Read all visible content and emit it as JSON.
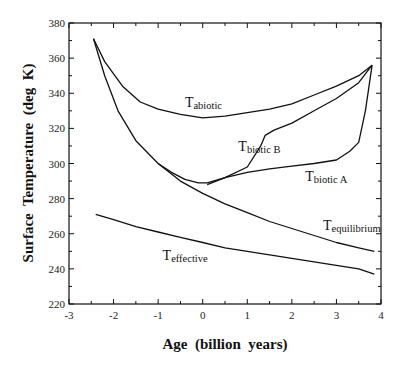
{
  "chart_data": {
    "type": "line",
    "title": "",
    "xlabel": "Age  (billion  years)",
    "ylabel": "Surface  Temperature  (deg  K)",
    "xlim": [
      -3,
      4
    ],
    "ylim": [
      220,
      380
    ],
    "xticks": [
      -3,
      -2,
      -1,
      0,
      1,
      2,
      3,
      4
    ],
    "xtick_labels": [
      "-3",
      "-2",
      "-1",
      "0",
      "1",
      "2",
      "3",
      "4"
    ],
    "yticks": [
      220,
      240,
      260,
      280,
      300,
      320,
      340,
      360,
      380
    ],
    "ytick_labels": [
      "220",
      "240",
      "260",
      "280",
      "300",
      "320",
      "340",
      "360",
      "380"
    ],
    "grid": false,
    "legend": "inline labels",
    "series": [
      {
        "name": "T_abiotic",
        "label_main": "T",
        "label_sub": "abiotic",
        "label_pos": [
          -0.4,
          332
        ],
        "points": [
          [
            -2.45,
            371
          ],
          [
            -2.2,
            358
          ],
          [
            -1.8,
            344
          ],
          [
            -1.4,
            335
          ],
          [
            -1.0,
            331
          ],
          [
            -0.5,
            328
          ],
          [
            0.0,
            326
          ],
          [
            0.5,
            327
          ],
          [
            1.0,
            329
          ],
          [
            1.5,
            331
          ],
          [
            2.0,
            334
          ],
          [
            2.5,
            339
          ],
          [
            3.0,
            344
          ],
          [
            3.5,
            350
          ],
          [
            3.8,
            356
          ]
        ]
      },
      {
        "name": "T_biotic B",
        "label_main": "T",
        "label_sub": "biotic B",
        "label_pos": [
          0.8,
          307
        ],
        "points": [
          [
            0.1,
            288
          ],
          [
            0.5,
            292
          ],
          [
            1.0,
            298
          ],
          [
            1.3,
            310
          ],
          [
            1.4,
            316
          ],
          [
            1.6,
            319
          ],
          [
            2.0,
            323
          ],
          [
            2.5,
            330
          ],
          [
            3.0,
            337
          ],
          [
            3.5,
            346
          ],
          [
            3.8,
            356
          ]
        ]
      },
      {
        "name": "T_biotic A",
        "label_main": "T",
        "label_sub": "biotic A",
        "label_pos": [
          2.3,
          290
        ],
        "points": [
          [
            -1.0,
            300
          ],
          [
            -0.7,
            295
          ],
          [
            -0.4,
            291
          ],
          [
            -0.1,
            289
          ],
          [
            0.1,
            289
          ],
          [
            0.5,
            292
          ],
          [
            1.0,
            295
          ],
          [
            1.5,
            297
          ],
          [
            2.0,
            298.5
          ],
          [
            2.5,
            300
          ],
          [
            3.0,
            302
          ],
          [
            3.3,
            307
          ],
          [
            3.5,
            312
          ],
          [
            3.65,
            330
          ],
          [
            3.8,
            356
          ]
        ]
      },
      {
        "name": "T_equilibrium",
        "label_main": "T",
        "label_sub": "equilibrium",
        "label_pos": [
          2.7,
          262
        ],
        "points": [
          [
            -2.45,
            371
          ],
          [
            -2.2,
            350
          ],
          [
            -1.9,
            330
          ],
          [
            -1.5,
            313
          ],
          [
            -1.0,
            300
          ],
          [
            -0.5,
            290
          ],
          [
            0.0,
            283
          ],
          [
            0.5,
            277
          ],
          [
            1.0,
            272
          ],
          [
            1.5,
            267
          ],
          [
            2.0,
            263
          ],
          [
            2.5,
            259
          ],
          [
            3.0,
            255
          ],
          [
            3.5,
            252
          ],
          [
            3.85,
            250
          ]
        ]
      },
      {
        "name": "T_effective",
        "label_main": "T",
        "label_sub": "effective",
        "label_pos": [
          -0.9,
          245
        ],
        "points": [
          [
            -2.4,
            271
          ],
          [
            -2.0,
            268
          ],
          [
            -1.5,
            264
          ],
          [
            -1.0,
            261
          ],
          [
            -0.5,
            258
          ],
          [
            0.0,
            255
          ],
          [
            0.5,
            252
          ],
          [
            1.0,
            250
          ],
          [
            1.5,
            248
          ],
          [
            2.0,
            246
          ],
          [
            2.5,
            244
          ],
          [
            3.0,
            242
          ],
          [
            3.5,
            240
          ],
          [
            3.85,
            237
          ]
        ]
      }
    ]
  }
}
